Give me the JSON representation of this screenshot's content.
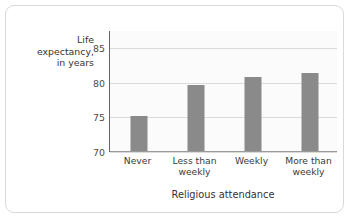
{
  "chart_data": {
    "type": "bar",
    "title": "",
    "categories": [
      "Never",
      "Less than weekly",
      "Weekly",
      "More than weekly"
    ],
    "category_lines": [
      [
        "Never"
      ],
      [
        "Less than",
        "weekly"
      ],
      [
        "Weekly"
      ],
      [
        "More than",
        "weekly"
      ]
    ],
    "values": [
      75.2,
      79.7,
      80.9,
      81.4
    ],
    "xlabel": "Religious attendance",
    "ylabel": "Life expectancy, in years",
    "ylabel_lines": [
      "Life",
      "expectancy,",
      "in years"
    ],
    "ylim": [
      70,
      87.5
    ],
    "yticks": [
      70,
      75,
      80,
      85
    ],
    "ytick_labels": [
      "70",
      "75",
      "80",
      "85"
    ],
    "grid": true,
    "legend": null,
    "colors": {
      "bar": "#8a8a8a",
      "gridline": "#dadada",
      "axis": "#666666",
      "plot_background": "#fbfbfb",
      "text": "#333333",
      "card_border": "#d9d9d9"
    }
  }
}
